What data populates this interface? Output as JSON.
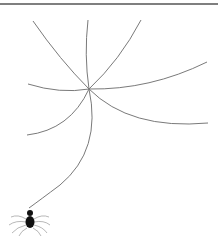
{
  "image": {
    "description": "Spider web clipart with a spider hanging from a silk thread",
    "colors": {
      "background": "#ffffff",
      "line": "#7a7a7a",
      "top_rule": "#555555",
      "spider": "#111111"
    }
  }
}
